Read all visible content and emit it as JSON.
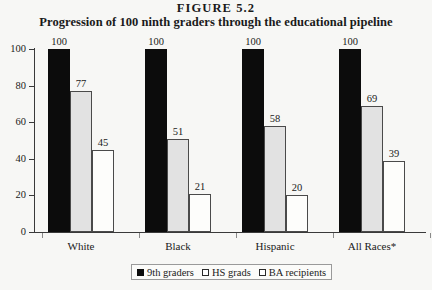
{
  "figure": {
    "label": "FIGURE  5.2"
  },
  "chart_data": {
    "type": "bar",
    "title": "Progression of 100 ninth graders through the educational pipeline",
    "figure_label": "FIGURE  5.2",
    "xlabel": "",
    "ylabel": "",
    "ylim": [
      0,
      100
    ],
    "yticks": [
      0,
      20,
      40,
      60,
      80,
      100
    ],
    "ytick_labels": [
      "0",
      "20",
      "40",
      "60",
      "80",
      "100"
    ],
    "grid": false,
    "legend_position": "bottom-center",
    "categories": [
      "White",
      "Black",
      "Hispanic",
      "All Races*"
    ],
    "series": [
      {
        "name": "9th graders",
        "color": "#0c0c0c",
        "values": [
          100,
          100,
          100,
          100
        ]
      },
      {
        "name": "HS grads",
        "color": "#e2e2e2",
        "values": [
          77,
          51,
          58,
          69
        ]
      },
      {
        "name": "BA recipients",
        "color": "#fdfdfb",
        "values": [
          45,
          21,
          20,
          39
        ]
      }
    ]
  },
  "legend": {
    "items": [
      {
        "label": "9th graders"
      },
      {
        "label": "HS grads"
      },
      {
        "label": "BA recipients"
      }
    ]
  }
}
